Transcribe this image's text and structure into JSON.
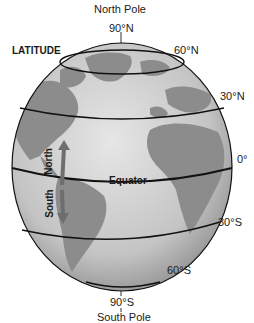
{
  "diagram": {
    "title": "LATITUDE",
    "poles": {
      "north": {
        "name": "North Pole",
        "degree": "90°N"
      },
      "south": {
        "name": "South Pole",
        "degree": "90°S"
      }
    },
    "latitude_lines": [
      {
        "label": "60°N"
      },
      {
        "label": "30°N"
      },
      {
        "label": "0°"
      },
      {
        "label": "30°S"
      },
      {
        "label": "60°S"
      }
    ],
    "equator_label": "Equator",
    "arrows": {
      "north": "North",
      "south": "South"
    },
    "colors": {
      "ocean": "#c8c8c8",
      "land": "#8c8c8c",
      "line": "#111111",
      "arrow": "#6e6e6e"
    }
  }
}
